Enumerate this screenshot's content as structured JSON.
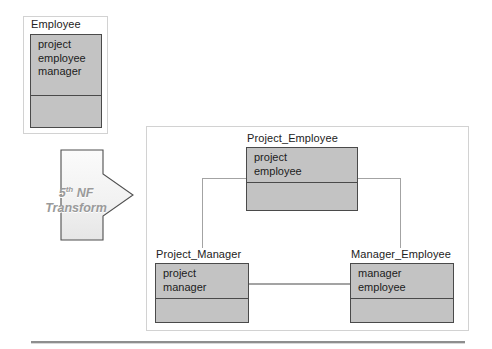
{
  "diagram": {
    "transform": {
      "label_line1_prefix": "5",
      "label_line1_sup": "th",
      "label_line1_suffix": " NF",
      "label_line2": "Transform",
      "icon": "right-arrow-icon"
    },
    "source": {
      "frame_name": "source-group",
      "entity": {
        "title": "Employee",
        "attributes": [
          "project",
          "employee",
          "manager"
        ],
        "has_empty_compartment": true
      }
    },
    "result": {
      "frame_name": "result-group",
      "entities": [
        {
          "title": "Project_Employee",
          "attributes": [
            "project",
            "employee"
          ],
          "has_empty_compartment": true
        },
        {
          "title": "Project_Manager",
          "attributes": [
            "project",
            "manager"
          ],
          "has_empty_compartment": true
        },
        {
          "title": "Manager_Employee",
          "attributes": [
            "manager",
            "employee"
          ],
          "has_empty_compartment": true
        }
      ],
      "connectors": [
        {
          "name": "project-employee-to-project-manager"
        },
        {
          "name": "project-employee-to-manager-employee"
        },
        {
          "name": "project-manager-to-manager-employee"
        }
      ]
    },
    "colors": {
      "entity_fill": "#c3c3c3",
      "entity_border": "#4a4a4a",
      "frame_border": "#d2d2d2",
      "connector": "#a3a3a3",
      "arrow_label_text": "#9a9a9a",
      "rule": "#8e8e8e"
    }
  }
}
